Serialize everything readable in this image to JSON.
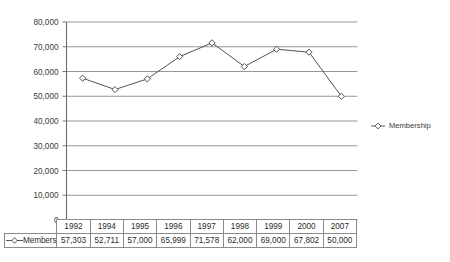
{
  "chart_data": {
    "type": "line",
    "title": "",
    "xlabel": "",
    "ylabel": "",
    "categories": [
      "1992",
      "1994",
      "1995",
      "1996",
      "1997",
      "1998",
      "1999",
      "2000",
      "2007"
    ],
    "series": [
      {
        "name": "Membership",
        "values": [
          57303,
          52711,
          57000,
          65999,
          71578,
          62000,
          69000,
          67802,
          50000
        ],
        "value_labels": [
          "57,303",
          "52,711",
          "57,000",
          "65,999",
          "71,578",
          "62,000",
          "69,000",
          "67,802",
          "50,000"
        ],
        "marker": "diamond-open",
        "color": "#4a4a4a"
      }
    ],
    "ylim": [
      0,
      80000
    ],
    "ytick_values": [
      0,
      10000,
      20000,
      30000,
      40000,
      50000,
      60000,
      70000,
      80000
    ],
    "ytick_labels": [
      "0",
      "10,000",
      "20,000",
      "30,000",
      "40,000",
      "50,000",
      "60,000",
      "70,000",
      "80,000"
    ],
    "grid": "horizontal",
    "legend_position": "right",
    "legend_entries": [
      "Membership"
    ],
    "data_table_visible": true,
    "axis_color": "#6e6e6e",
    "grid_color": "#8a8a8a",
    "background": "#ffffff"
  },
  "data_table": {
    "row_header_label": "Membership",
    "column_headers": [
      "1992",
      "1994",
      "1995",
      "1996",
      "1997",
      "1998",
      "1999",
      "2000",
      "2007"
    ],
    "rows": [
      {
        "label": "Membership",
        "values": [
          "57,303",
          "52,711",
          "57,000",
          "65,999",
          "71,578",
          "62,000",
          "69,000",
          "67,802",
          "50,000"
        ]
      }
    ]
  },
  "legend": {
    "items": [
      {
        "label": "Membership",
        "marker": "diamond-open"
      }
    ]
  }
}
